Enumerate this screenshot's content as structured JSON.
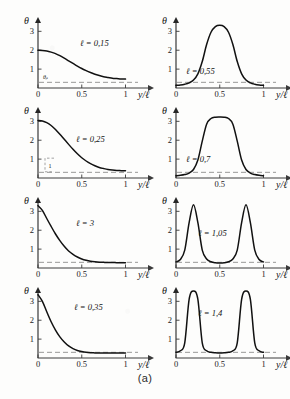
{
  "figure": {
    "caption": "(a)",
    "axis_y_label": "θ",
    "axis_x_label": "y/ℓ",
    "threshold_label": "θᵦ",
    "bracket_label": "1"
  },
  "chart_data": [
    {
      "id": "panel-l-0-15",
      "type": "line",
      "title": "ℓ = 0,15",
      "curve_label": "ℓ = 0,15",
      "xlabel": "y/ℓ",
      "ylabel": "θ",
      "xlim": [
        0,
        1.12
      ],
      "ylim": [
        0,
        3.6
      ],
      "xticks": [
        0,
        0.5,
        1
      ],
      "xtick_labels": [
        "0",
        "0.5",
        "1"
      ],
      "yticks": [
        1,
        2,
        3
      ],
      "ytick_labels": [
        "1",
        "2",
        "3"
      ],
      "threshold": 0.3,
      "threshold_label": "θᵦ",
      "grid": false,
      "x": [
        0.0,
        0.05,
        0.1,
        0.15,
        0.2,
        0.25,
        0.3,
        0.35,
        0.4,
        0.45,
        0.5,
        0.55,
        0.6,
        0.65,
        0.7,
        0.75,
        0.8,
        0.85,
        0.9,
        0.95,
        1.0
      ],
      "y": [
        2.0,
        1.99,
        1.96,
        1.9,
        1.82,
        1.71,
        1.58,
        1.44,
        1.3,
        1.16,
        1.03,
        0.92,
        0.82,
        0.73,
        0.66,
        0.6,
        0.56,
        0.52,
        0.5,
        0.48,
        0.47
      ]
    },
    {
      "id": "panel-l-0-55",
      "type": "line",
      "title": "ℓ = 0,55",
      "curve_label": "ℓ = 0,55",
      "xlabel": "y/ℓ",
      "ylabel": "θ",
      "xlim": [
        0,
        1.12
      ],
      "ylim": [
        0,
        3.6
      ],
      "xticks": [
        0,
        0.5,
        1
      ],
      "xtick_labels": [
        "0",
        "0.5",
        "1"
      ],
      "yticks": [
        1,
        2,
        3
      ],
      "ytick_labels": [
        "1",
        "2",
        "3"
      ],
      "threshold": 0.3,
      "grid": false,
      "x": [
        0.0,
        0.05,
        0.1,
        0.15,
        0.2,
        0.25,
        0.3,
        0.35,
        0.4,
        0.45,
        0.5,
        0.55,
        0.6,
        0.65,
        0.7,
        0.75,
        0.8,
        0.85,
        0.9,
        0.95,
        1.0
      ],
      "y": [
        0.14,
        0.16,
        0.2,
        0.27,
        0.42,
        0.75,
        1.4,
        2.3,
        2.95,
        3.25,
        3.32,
        3.25,
        2.95,
        2.3,
        1.4,
        0.75,
        0.42,
        0.27,
        0.2,
        0.16,
        0.14
      ]
    },
    {
      "id": "panel-l-0-25",
      "type": "line",
      "title": "ℓ = 0,25",
      "curve_label": "ℓ = 0,25",
      "xlabel": "y/ℓ",
      "ylabel": "θ",
      "xlim": [
        0,
        1.12
      ],
      "ylim": [
        0,
        3.6
      ],
      "xticks": [
        0,
        0.5,
        1
      ],
      "xtick_labels": [
        "0",
        "0.5",
        "1"
      ],
      "yticks": [
        1,
        2,
        3
      ],
      "ytick_labels": [
        "1",
        "2",
        "3"
      ],
      "threshold": 0.3,
      "bracket_label": "1",
      "grid": false,
      "x": [
        0.0,
        0.05,
        0.1,
        0.15,
        0.2,
        0.25,
        0.3,
        0.35,
        0.4,
        0.45,
        0.5,
        0.55,
        0.6,
        0.65,
        0.7,
        0.75,
        0.8,
        0.85,
        0.9,
        0.95,
        1.0
      ],
      "y": [
        3.05,
        3.02,
        2.93,
        2.78,
        2.57,
        2.32,
        2.05,
        1.78,
        1.52,
        1.28,
        1.07,
        0.9,
        0.76,
        0.65,
        0.56,
        0.5,
        0.45,
        0.42,
        0.4,
        0.39,
        0.38
      ]
    },
    {
      "id": "panel-l-0-7",
      "type": "line",
      "title": "ℓ = 0,7",
      "curve_label": "ℓ = 0,7",
      "xlabel": "y/ℓ",
      "ylabel": "θ",
      "xlim": [
        0,
        1.12
      ],
      "ylim": [
        0,
        3.6
      ],
      "xticks": [
        0,
        0.5,
        1
      ],
      "xtick_labels": [
        "0",
        "0.5",
        "1"
      ],
      "yticks": [
        1,
        2,
        3
      ],
      "ytick_labels": [
        "1",
        "2",
        "3"
      ],
      "threshold": 0.3,
      "grid": false,
      "x": [
        0.0,
        0.05,
        0.1,
        0.15,
        0.2,
        0.25,
        0.3,
        0.35,
        0.4,
        0.45,
        0.5,
        0.55,
        0.6,
        0.65,
        0.7,
        0.75,
        0.8,
        0.85,
        0.9,
        0.95,
        1.0
      ],
      "y": [
        0.12,
        0.14,
        0.18,
        0.26,
        0.45,
        0.95,
        1.95,
        2.85,
        3.15,
        3.22,
        3.23,
        3.22,
        3.15,
        2.85,
        1.95,
        0.95,
        0.45,
        0.26,
        0.18,
        0.14,
        0.12
      ]
    },
    {
      "id": "panel-l-3",
      "type": "line",
      "title": "ℓ = 3",
      "curve_label": "ℓ = 3",
      "xlabel": "y/ℓ",
      "ylabel": "θ",
      "xlim": [
        0,
        1.12
      ],
      "ylim": [
        0,
        3.6
      ],
      "xticks": [
        0,
        0.5,
        1
      ],
      "xtick_labels": [
        "0",
        "0.5",
        "1"
      ],
      "yticks": [
        1,
        2,
        3
      ],
      "ytick_labels": [
        "1",
        "2",
        "3"
      ],
      "threshold": 0.3,
      "grid": false,
      "x": [
        0.0,
        0.05,
        0.1,
        0.15,
        0.2,
        0.25,
        0.3,
        0.35,
        0.4,
        0.45,
        0.5,
        0.55,
        0.6,
        0.65,
        0.7,
        0.75,
        0.8,
        0.85,
        0.9,
        0.95,
        1.0
      ],
      "y": [
        3.3,
        3.05,
        2.62,
        2.2,
        1.8,
        1.45,
        1.15,
        0.9,
        0.72,
        0.58,
        0.48,
        0.41,
        0.36,
        0.33,
        0.31,
        0.3,
        0.29,
        0.29,
        0.28,
        0.28,
        0.28
      ]
    },
    {
      "id": "panel-l-1-05",
      "type": "line",
      "title": "ℓ = 1,05",
      "curve_label": "ℓ = 1,05",
      "xlabel": "y/ℓ",
      "ylabel": "θ",
      "xlim": [
        0,
        1.12
      ],
      "ylim": [
        0,
        3.6
      ],
      "xticks": [
        0,
        0.5,
        1
      ],
      "xtick_labels": [
        "0",
        "0.5",
        "1"
      ],
      "yticks": [
        1,
        2,
        3
      ],
      "ytick_labels": [
        "1",
        "2",
        "3"
      ],
      "threshold": 0.3,
      "grid": false,
      "x": [
        0.0,
        0.05,
        0.1,
        0.15,
        0.2,
        0.25,
        0.3,
        0.35,
        0.4,
        0.45,
        0.5,
        0.55,
        0.6,
        0.65,
        0.7,
        0.75,
        0.8,
        0.85,
        0.9,
        0.95,
        1.0
      ],
      "y": [
        0.32,
        0.45,
        0.95,
        2.4,
        3.35,
        2.4,
        0.95,
        0.48,
        0.33,
        0.28,
        0.27,
        0.28,
        0.33,
        0.48,
        0.95,
        2.4,
        3.35,
        2.4,
        0.95,
        0.45,
        0.32
      ]
    },
    {
      "id": "panel-l-0-35",
      "type": "line",
      "title": "ℓ = 0,35",
      "curve_label": "ℓ = 0,35",
      "xlabel": "y/ℓ",
      "ylabel": "θ",
      "xlim": [
        0,
        1.12
      ],
      "ylim": [
        0,
        3.6
      ],
      "xticks": [
        0,
        0.5,
        1
      ],
      "xtick_labels": [
        "0",
        "0.5",
        "1"
      ],
      "yticks": [
        1,
        2,
        3
      ],
      "ytick_labels": [
        "1",
        "2",
        "3"
      ],
      "threshold": 0.3,
      "grid": false,
      "x": [
        0.0,
        0.05,
        0.1,
        0.15,
        0.2,
        0.25,
        0.3,
        0.35,
        0.4,
        0.45,
        0.5,
        0.55,
        0.6,
        0.65,
        0.7,
        0.75,
        0.8,
        0.85,
        0.9,
        0.95,
        1.0
      ],
      "y": [
        3.35,
        3.0,
        2.45,
        1.92,
        1.48,
        1.12,
        0.85,
        0.64,
        0.5,
        0.4,
        0.34,
        0.3,
        0.28,
        0.27,
        0.26,
        0.26,
        0.26,
        0.26,
        0.26,
        0.26,
        0.26
      ]
    },
    {
      "id": "panel-l-1-4",
      "type": "line",
      "title": "ℓ = 1,4",
      "curve_label": "ℓ = 1,4",
      "xlabel": "y/ℓ",
      "ylabel": "θ",
      "xlim": [
        0,
        1.12
      ],
      "ylim": [
        0,
        3.6
      ],
      "xticks": [
        0,
        0.5,
        1
      ],
      "xtick_labels": [
        "0",
        "0.5",
        "1"
      ],
      "yticks": [
        1,
        2,
        3
      ],
      "ytick_labels": [
        "1",
        "2",
        "3"
      ],
      "threshold": 0.3,
      "grid": false,
      "x": [
        0.0,
        0.05,
        0.1,
        0.15,
        0.2,
        0.25,
        0.3,
        0.35,
        0.4,
        0.45,
        0.5,
        0.55,
        0.6,
        0.65,
        0.7,
        0.75,
        0.8,
        0.85,
        0.9,
        0.95,
        1.0
      ],
      "y": [
        0.3,
        0.38,
        0.8,
        3.1,
        3.55,
        3.1,
        0.8,
        0.38,
        0.3,
        0.28,
        0.27,
        0.28,
        0.3,
        0.38,
        0.8,
        3.1,
        3.55,
        3.1,
        0.8,
        0.38,
        0.3
      ]
    }
  ],
  "colors": {
    "curve": "#111111",
    "axis": "#3a3a3a",
    "dash": "#8d8d8d",
    "background": "#fdfdfc"
  }
}
